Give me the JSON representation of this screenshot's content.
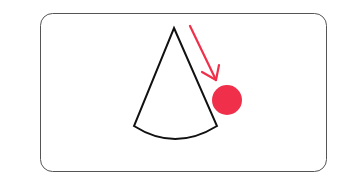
{
  "diagram": {
    "colors": {
      "frame": "#555555",
      "cone_outline": "#111111",
      "accent": "#f0304a"
    },
    "shapes": {
      "frame": {
        "x": 40,
        "y": 13,
        "width": 286,
        "height": 158,
        "radius": 12
      },
      "cone": {
        "apex": [
          174,
          28
        ],
        "left_base": [
          134,
          126
        ],
        "right_base": [
          217,
          126
        ],
        "arc_bottom": [
          173,
          143
        ]
      },
      "arrow": {
        "from": [
          190,
          26
        ],
        "to": [
          216,
          80
        ]
      },
      "ball": {
        "cx": 227,
        "cy": 100,
        "r": 15
      }
    }
  }
}
